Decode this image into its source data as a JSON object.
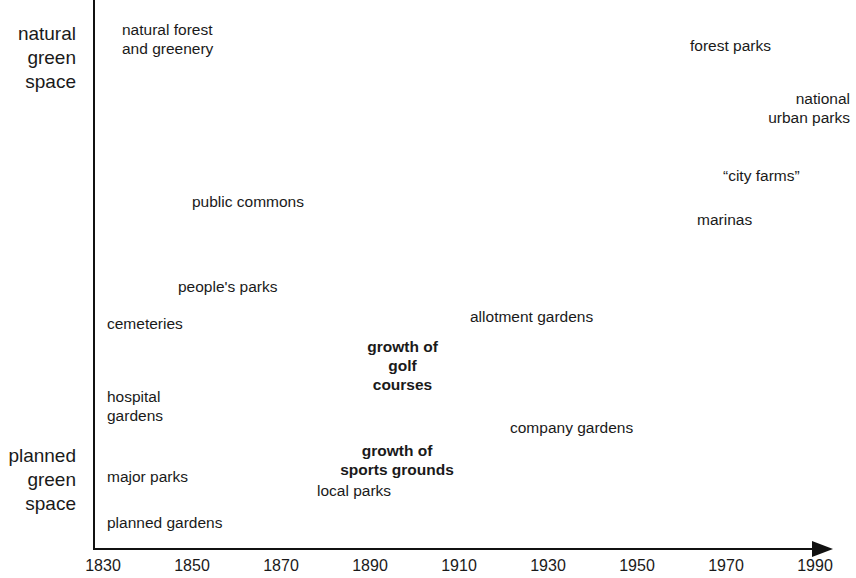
{
  "chart_data": {
    "type": "scatter",
    "title": "",
    "xlabel": "",
    "ylabel": "",
    "x_ticks": [
      "1830",
      "1850",
      "1870",
      "1890",
      "1910",
      "1930",
      "1950",
      "1970",
      "1990"
    ],
    "xlim": [
      1830,
      1990
    ],
    "y_axis_categories": [
      "planned green space",
      "natural green space"
    ],
    "grid": false,
    "legend": null,
    "axis_labels": {
      "top": "natural\ngreen\nspace",
      "bottom": "planned\ngreen\nspace"
    },
    "points": [
      {
        "label": "natural forest\nand greenery",
        "x": 1835,
        "y": 0.97,
        "bold": false,
        "align": "left"
      },
      {
        "label": "forest parks",
        "x": 1957,
        "y": 0.93,
        "bold": false,
        "align": "left"
      },
      {
        "label": "national\nurban parks",
        "x": 1976,
        "y": 0.83,
        "bold": false,
        "align": "right"
      },
      {
        "label": "“city farms”",
        "x": 1967,
        "y": 0.7,
        "bold": false,
        "align": "left"
      },
      {
        "label": "public commons",
        "x": 1853,
        "y": 0.65,
        "bold": false,
        "align": "left"
      },
      {
        "label": "marinas",
        "x": 1958,
        "y": 0.62,
        "bold": false,
        "align": "left"
      },
      {
        "label": "people's parks",
        "x": 1850,
        "y": 0.51,
        "bold": false,
        "align": "left"
      },
      {
        "label": "allotment gardens",
        "x": 1914,
        "y": 0.45,
        "bold": false,
        "align": "left"
      },
      {
        "label": "cemeteries",
        "x": 1834,
        "y": 0.44,
        "bold": false,
        "align": "left"
      },
      {
        "label": "growth of\ngolf courses",
        "x": 1898,
        "y": 0.38,
        "bold": true,
        "align": "center"
      },
      {
        "label": "hospital\ngardens",
        "x": 1834,
        "y": 0.3,
        "bold": false,
        "align": "left"
      },
      {
        "label": "company gardens",
        "x": 1924,
        "y": 0.26,
        "bold": false,
        "align": "left"
      },
      {
        "label": "growth of\nsports grounds",
        "x": 1897,
        "y": 0.2,
        "bold": true,
        "align": "center"
      },
      {
        "label": "major parks",
        "x": 1834,
        "y": 0.17,
        "bold": false,
        "align": "left"
      },
      {
        "label": "local parks",
        "x": 1890,
        "y": 0.14,
        "bold": false,
        "align": "left"
      },
      {
        "label": "planned gardens",
        "x": 1834,
        "y": 0.08,
        "bold": false,
        "align": "left"
      }
    ]
  },
  "axis": {
    "y_top_label": "natural\ngreen\nspace",
    "y_bottom_label": "planned\ngreen\nspace",
    "years": [
      "1830",
      "1850",
      "1870",
      "1890",
      "1910",
      "1930",
      "1950",
      "1970",
      "1990"
    ]
  },
  "items": [
    {
      "text": "natural forest\nand greenery",
      "left": 122,
      "top": 20,
      "align": "left",
      "bold": false
    },
    {
      "text": "forest parks",
      "left": 690,
      "top": 36,
      "align": "left",
      "bold": false
    },
    {
      "text": "national\nurban parks",
      "right": 6,
      "top": 89,
      "align": "right",
      "bold": false
    },
    {
      "text": "“city farms”",
      "left": 723,
      "top": 166,
      "align": "left",
      "bold": false
    },
    {
      "text": "public commons",
      "left": 192,
      "top": 192,
      "align": "left",
      "bold": false
    },
    {
      "text": "marinas",
      "left": 697,
      "top": 210,
      "align": "left",
      "bold": false
    },
    {
      "text": "people's parks",
      "left": 178,
      "top": 277,
      "align": "left",
      "bold": false
    },
    {
      "text": "allotment gardens",
      "left": 470,
      "top": 307,
      "align": "left",
      "bold": false
    },
    {
      "text": "cemeteries",
      "left": 107,
      "top": 314,
      "align": "left",
      "bold": false
    },
    {
      "text": "growth of\ngolf courses",
      "left": 357,
      "top": 337,
      "align": "center",
      "bold": true,
      "width": 91
    },
    {
      "text": "hospital\ngardens",
      "left": 107,
      "top": 387,
      "align": "left",
      "bold": false
    },
    {
      "text": "company gardens",
      "left": 510,
      "top": 418,
      "align": "left",
      "bold": false
    },
    {
      "text": "growth of\nsports grounds",
      "left": 337,
      "top": 441,
      "align": "center",
      "bold": true,
      "width": 120
    },
    {
      "text": "major parks",
      "left": 107,
      "top": 467,
      "align": "left",
      "bold": false
    },
    {
      "text": "local parks",
      "left": 317,
      "top": 481,
      "align": "left",
      "bold": false
    },
    {
      "text": "planned gardens",
      "left": 107,
      "top": 513,
      "align": "left",
      "bold": false
    }
  ]
}
